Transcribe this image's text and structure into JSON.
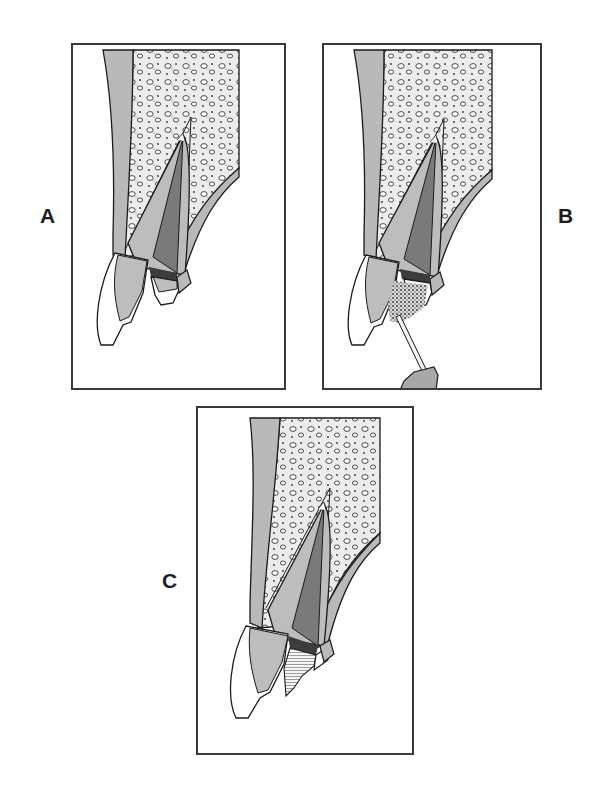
{
  "figure": {
    "panels": [
      {
        "id": "A",
        "label": "A",
        "description": "Tooth in alveolar bone with crown fracture exposing pulp"
      },
      {
        "id": "B",
        "label": "B",
        "description": "Application of material to fracture site with instrument"
      },
      {
        "id": "C",
        "label": "C",
        "description": "Restored crown with hatched composite restoration"
      }
    ],
    "colors": {
      "frame": "#3a3a3a",
      "bone_fill": "#e9e9e9",
      "cortical": "#b9b9b9",
      "dentin": "#bdbdbd",
      "pulp": "#7a7a7a",
      "pulp_seal": "#3c3c3c",
      "enamel": "#ffffff",
      "outline": "#1a1a1a"
    }
  }
}
